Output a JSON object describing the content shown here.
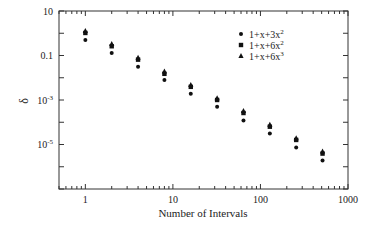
{
  "chart_data": {
    "type": "scatter",
    "title": "",
    "xlabel": "Number of Intervals",
    "ylabel": "δ",
    "xscale": "log",
    "yscale": "log",
    "xlim": [
      0.5,
      1000
    ],
    "ylim": [
      1e-07,
      10
    ],
    "grid": false,
    "legend_position": "upper right",
    "x_ticks": [
      {
        "value": 1,
        "label": "1"
      },
      {
        "value": 10,
        "label": "10"
      },
      {
        "value": 100,
        "label": "100"
      },
      {
        "value": 1000,
        "label": "1000"
      }
    ],
    "y_ticks": [
      {
        "value": 10,
        "label": "10",
        "exp": ""
      },
      {
        "value": 0.1,
        "label": "0.1",
        "exp": ""
      },
      {
        "value": 0.001,
        "label": "10",
        "exp": "-3"
      },
      {
        "value": 1e-05,
        "label": "10",
        "exp": "-5"
      }
    ],
    "x": [
      1,
      2,
      4,
      8,
      16,
      32,
      64,
      128,
      256,
      512
    ],
    "series": [
      {
        "name": "1+x+3x²",
        "label_base": "1+x+3x",
        "label_exp": "2",
        "marker": "circle",
        "color": "#111111",
        "values": [
          0.5,
          0.13,
          0.031,
          0.008,
          0.0019,
          0.0005,
          0.00012,
          3.1e-05,
          7.3e-06,
          1.9e-06
        ]
      },
      {
        "name": "1+x+6x²",
        "label_base": "1+x+6x",
        "label_exp": "2",
        "marker": "square",
        "color": "#111111",
        "values": [
          1.03,
          0.26,
          0.065,
          0.015,
          0.0039,
          0.001,
          0.00026,
          6.3e-05,
          1.6e-05,
          3.9e-06
        ]
      },
      {
        "name": "1+x+6x³",
        "label_base": "1+x+6x",
        "label_exp": "3",
        "marker": "triangle",
        "color": "#111111",
        "values": [
          1.27,
          0.33,
          0.08,
          0.019,
          0.0047,
          0.0012,
          0.00032,
          7.7e-05,
          1.9e-05,
          4.8e-06
        ]
      }
    ]
  }
}
